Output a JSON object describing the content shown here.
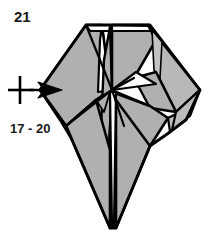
{
  "figure": {
    "kind": "origami-fold-diagram",
    "step_number": "21",
    "repeat_label": "17 - 20",
    "repeat_symbol": {
      "name": "repeat-arrow-symbol",
      "meaning": "repeat steps on the other side",
      "cross_x": 20,
      "cross_y": 90,
      "arrow_tip_x": 62,
      "arrow_tail_x": 30
    },
    "colors": {
      "paper_front": "#b0b0b0",
      "paper_front_light": "#c0c0c0",
      "paper_back": "#ffffff",
      "outline": "#000000",
      "text": "#1a1a1a",
      "background": "#ffffff"
    },
    "geometry": {
      "top_edge_y": 25,
      "center_x": 112,
      "center_y": 92,
      "bottom_tip_y": 228,
      "left_tip_x": 40,
      "right_tip_x": 200
    }
  }
}
